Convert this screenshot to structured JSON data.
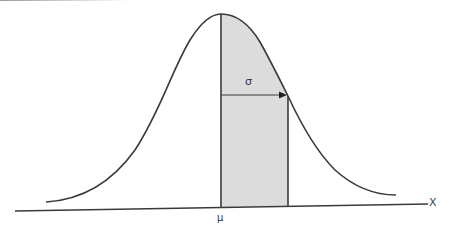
{
  "diagram": {
    "labels": {
      "sigma": "σ",
      "mu": "μ",
      "x_axis": "X"
    },
    "colors": {
      "curve": "#3a3a3a",
      "axis": "#3a3a3a",
      "shaded_region": "#dcdcdc",
      "background": "#ffffff"
    },
    "elements": {
      "curve": "bell-shaped normal density curve",
      "mean_line": "vertical line at mean μ",
      "sigma_line": "vertical line at μ + σ",
      "sigma_arrow": "horizontal arrow from μ to μ + σ",
      "shaded_region": "area under curve between μ and μ + σ"
    }
  }
}
